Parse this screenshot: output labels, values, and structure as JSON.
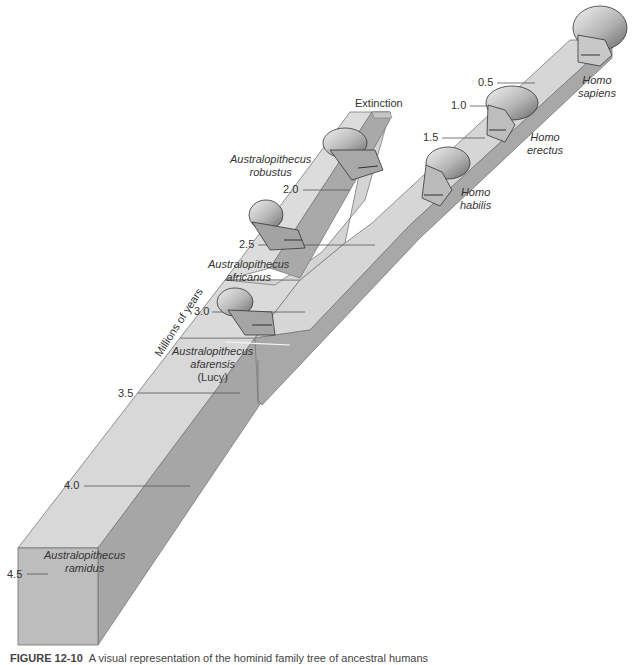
{
  "diagram": {
    "axis_title": "Millions of years",
    "extinction_label": "Extinction",
    "ticks": [
      {
        "value": "0.5",
        "x": 478,
        "y": 76
      },
      {
        "value": "1.0",
        "x": 451,
        "y": 99
      },
      {
        "value": "1.5",
        "x": 423,
        "y": 131
      },
      {
        "value": "2.0",
        "x": 283,
        "y": 183
      },
      {
        "value": "2.5",
        "x": 239,
        "y": 238
      },
      {
        "value": "3.0",
        "x": 194,
        "y": 305
      },
      {
        "value": "3.5",
        "x": 118,
        "y": 387
      },
      {
        "value": "4.0",
        "x": 64,
        "y": 479
      },
      {
        "value": "4.5",
        "x": 7,
        "y": 568
      }
    ],
    "species": [
      {
        "genus": "Homo",
        "epithet": "sapiens",
        "lineage": "Homo",
        "time_mya": "0.5"
      },
      {
        "genus": "Homo",
        "epithet": "erectus",
        "lineage": "Homo",
        "time_mya": "1.5"
      },
      {
        "genus": "Homo",
        "epithet": "habilis",
        "lineage": "Homo",
        "time_mya": "2.0"
      },
      {
        "genus": "Australopithecus",
        "epithet": "robustus",
        "lineage": "Australopithecus (extinct branch)",
        "time_mya": "2.0"
      },
      {
        "genus": "Australopithecus",
        "epithet": "africanus",
        "lineage": "Australopithecus",
        "time_mya": "2.5"
      },
      {
        "genus": "Australopithecus",
        "epithet": "afarensis",
        "note": "(Lucy)",
        "lineage": "Australopithecus",
        "time_mya": "3.0"
      },
      {
        "genus": "Australopithecus",
        "epithet": "ramidus",
        "lineage": "Australopithecus",
        "time_mya": "4.5"
      }
    ],
    "colors": {
      "beam_top": "#d9d9d9",
      "beam_side": "#a9a9a9",
      "beam_front": "#bcbcbc",
      "edge": "#777777",
      "tick_line": "#555555",
      "text": "#333333"
    }
  },
  "caption": {
    "figure_label": "FIGURE 12-10",
    "text": "A visual representation of the hominid family tree of ancestral humans"
  }
}
